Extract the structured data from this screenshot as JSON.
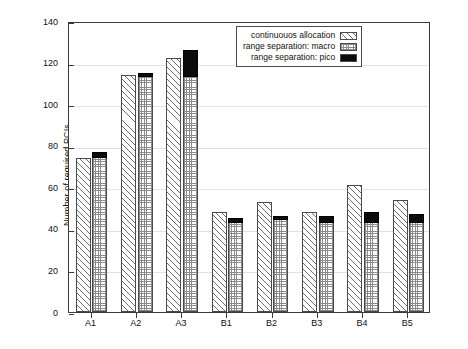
{
  "chart_data": {
    "type": "bar",
    "title": "",
    "xlabel": "",
    "ylabel": "Number of required PCIs",
    "categories": [
      "A1",
      "A2",
      "A3",
      "B1",
      "B2",
      "B3",
      "B4",
      "B5"
    ],
    "ylim": [
      0,
      140
    ],
    "ytick_values": [
      0,
      20,
      40,
      60,
      80,
      100,
      120,
      140
    ],
    "ytick_labels": [
      "0",
      "20",
      "40",
      "60",
      "80",
      "100",
      "120",
      "140"
    ],
    "grid": true,
    "grid_axis": "y",
    "legend_position": "upper right",
    "series": [
      {
        "name": "continuouos allocation",
        "pattern": "diagonal-hatch",
        "color": "#ffffff",
        "values": [
          74,
          114,
          122,
          48,
          53,
          48,
          61,
          54
        ]
      },
      {
        "name": "range separation: macro",
        "pattern": "crosshatch",
        "color": "#ffffff",
        "values": [
          75,
          114,
          114,
          44,
          45,
          44,
          44,
          44
        ]
      },
      {
        "name": "range separation: pico",
        "pattern": "solid",
        "color": "#0b0b0b",
        "stacked_on": "range separation: macro",
        "values": [
          3,
          2,
          13,
          2,
          2,
          3,
          5,
          4
        ],
        "stack_tops": [
          78,
          116,
          127,
          46,
          47,
          47,
          49,
          48
        ]
      }
    ]
  },
  "legend": {
    "items": [
      {
        "label": "continuouos allocation",
        "swatch": "diagonal-hatch-swatch"
      },
      {
        "label": "range separation: macro",
        "swatch": "crosshatch-swatch"
      },
      {
        "label": "range separation: pico",
        "swatch": "solid-black-swatch"
      }
    ]
  },
  "axes": {
    "y_title": "Number of required PCIs"
  }
}
